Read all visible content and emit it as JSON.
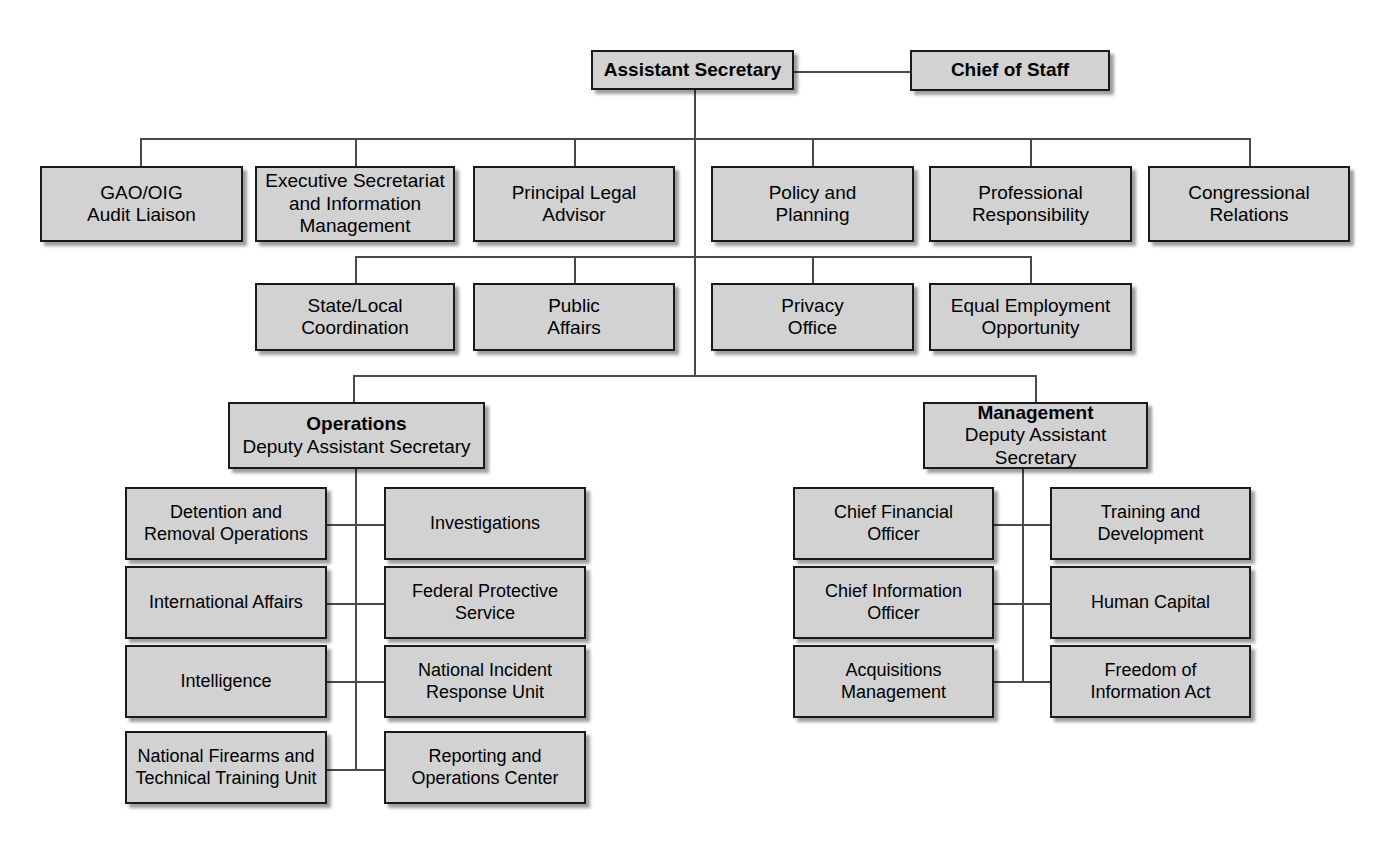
{
  "chart_title": "Assistant Secretary Organization Chart",
  "style": {
    "box_fill": "#d2d2d2",
    "box_border": "#1a1a1a",
    "line_color": "#4a4a4a",
    "background": "#ffffff",
    "text_color": "#000000"
  },
  "tier1": {
    "assistant_secretary": "Assistant Secretary",
    "chief_of_staff": "Chief of Staff"
  },
  "tier2": [
    {
      "label": "GAO/OIG\nAudit Liaison"
    },
    {
      "label": "Executive Secretariat\nand  Information\nManagement"
    },
    {
      "label": "Principal Legal\nAdvisor"
    },
    {
      "label": "Policy and\nPlanning"
    },
    {
      "label": "Professional\nResponsibility"
    },
    {
      "label": "Congressional\nRelations"
    }
  ],
  "tier3": [
    {
      "label": "State/Local\nCoordination"
    },
    {
      "label": "Public\nAffairs"
    },
    {
      "label": "Privacy\nOffice"
    },
    {
      "label": "Equal Employment\nOpportunity"
    }
  ],
  "divisions": [
    {
      "head": "Operations",
      "sub": "Deputy Assistant Secretary",
      "left_column": [
        {
          "label": "Detention and\nRemoval Operations"
        },
        {
          "label": "International Affairs"
        },
        {
          "label": "Intelligence"
        },
        {
          "label": "National Firearms and\nTechnical Training Unit"
        }
      ],
      "right_column": [
        {
          "label": "Investigations"
        },
        {
          "label": "Federal Protective\nService"
        },
        {
          "label": "National Incident\nResponse Unit"
        },
        {
          "label": "Reporting and\nOperations Center"
        }
      ]
    },
    {
      "head": "Management",
      "sub": "Deputy Assistant Secretary",
      "left_column": [
        {
          "label": "Chief Financial\nOfficer"
        },
        {
          "label": "Chief Information\nOfficer"
        },
        {
          "label": "Acquisitions\nManagement"
        }
      ],
      "right_column": [
        {
          "label": "Training and\nDevelopment"
        },
        {
          "label": "Human Capital"
        },
        {
          "label": "Freedom of\nInformation Act"
        }
      ]
    }
  ]
}
